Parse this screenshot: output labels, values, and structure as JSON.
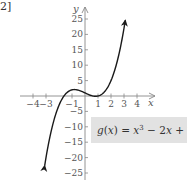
{
  "corner_label": "2]",
  "chart_data": {
    "type": "line",
    "title": "",
    "function": "g(x) = x^3 - 2x + 1",
    "label": {
      "fn": "g",
      "var": "x",
      "text": "g(x) = x³ − 2x + 1"
    },
    "xlabel": "x",
    "ylabel": "y",
    "xlim": [
      -4.5,
      5
    ],
    "ylim": [
      -27,
      28
    ],
    "x_ticks": [
      -4,
      -3,
      -1,
      1,
      2,
      3,
      4
    ],
    "x_tick_labels": [
      "−4",
      "−3",
      "−1",
      "1",
      "2",
      "3",
      "4"
    ],
    "y_ticks": [
      25,
      20,
      15,
      10,
      5,
      -5,
      -10,
      -15,
      -20,
      -25
    ],
    "y_tick_labels": [
      "25",
      "20",
      "15",
      "10",
      "5",
      "−5",
      "−10",
      "−15",
      "−20",
      "−25"
    ],
    "grid": false,
    "series": [
      {
        "name": "g(x)",
        "x": [
          -3.1,
          -2.5,
          -2,
          -1.5,
          -1,
          -0.816,
          -0.5,
          0,
          0.5,
          0.816,
          1,
          1.5,
          2,
          2.5,
          3,
          3.1
        ],
        "y": [
          -22.6,
          -9.6,
          -3,
          1.6,
          2,
          2.09,
          1.88,
          1,
          0.13,
          -0.09,
          0,
          1.38,
          5,
          11.6,
          22,
          24.6
        ]
      }
    ],
    "features": {
      "local_max": [
        -0.816,
        2.09
      ],
      "local_min": [
        0.816,
        -0.09
      ],
      "roots": [
        -1.618,
        0.618,
        1
      ]
    },
    "colors": {
      "curve": "#1a1a1a",
      "axis": "#888888",
      "label_box": "#e2e2e2",
      "text": "#555555"
    }
  }
}
